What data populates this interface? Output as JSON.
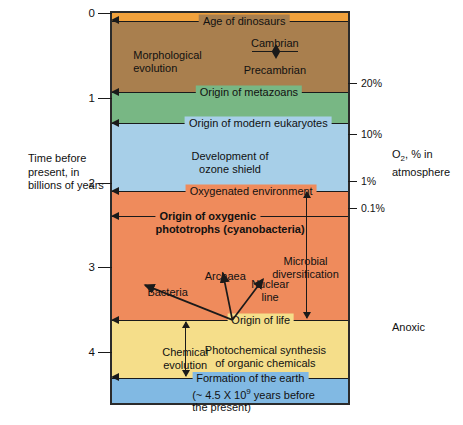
{
  "figure": {
    "left_axis_caption_line1": "Time before",
    "left_axis_caption_line2": "present, in",
    "left_axis_caption_line3": "billions of years",
    "right_axis_caption_line1": "O",
    "right_axis_caption_sub": "2",
    "right_axis_caption_line1b": ", % in",
    "right_axis_caption_line2": "atmosphere",
    "anoxic_label": "Anoxic"
  },
  "chart_data": {
    "type": "timeline",
    "ylabel": "Time before present, in billions of years",
    "ylim": [
      0,
      4.6
    ],
    "y_ticks": [
      {
        "label": "0",
        "value": 0
      },
      {
        "label": "1",
        "value": 1
      },
      {
        "label": "2",
        "value": 2
      },
      {
        "label": "3",
        "value": 3
      },
      {
        "label": "4",
        "value": 4
      }
    ],
    "right_axis_label": "O2, % in atmosphere",
    "right_ticks": [
      {
        "label": "20%",
        "value": 0.83
      },
      {
        "label": "10%",
        "value": 1.43
      },
      {
        "label": "1%",
        "value": 1.98
      },
      {
        "label": "0.1%",
        "value": 2.3
      }
    ],
    "grid": false,
    "legend": "none",
    "bands": [
      {
        "name": "present-atmosphere",
        "color": "#f2a23c",
        "from": 0.0,
        "to": 0.09
      },
      {
        "name": "morphological-evolution-era",
        "color": "#a97f4e",
        "from": 0.09,
        "to": 0.93
      },
      {
        "name": "metazoan-era",
        "color": "#78b784",
        "from": 0.93,
        "to": 1.3
      },
      {
        "name": "ozone-shield-era",
        "color": "#a7cfe8",
        "from": 1.3,
        "to": 2.1
      },
      {
        "name": "oxygenic-phototroph-era",
        "color": "#ef8b5c",
        "from": 2.1,
        "to": 3.62
      },
      {
        "name": "prebiotic-era",
        "color": "#f5de8a",
        "from": 3.62,
        "to": 4.3
      },
      {
        "name": "pre-earth",
        "color": "#81b9e3",
        "from": 4.3,
        "to": 4.6
      }
    ],
    "events": [
      {
        "label": "Age of dinosaurs",
        "value": 0.09,
        "bold": false,
        "text_x_pct": 56
      },
      {
        "label": "Origin of metazoans",
        "value": 0.93,
        "bold": false,
        "text_x_pct": 58
      },
      {
        "label": "Origin of modern eukaryotes",
        "value": 1.3,
        "bold": false,
        "text_x_pct": 62
      },
      {
        "label": "Oxygenated environment",
        "value": 2.1,
        "bold": false,
        "text_x_pct": 59
      },
      {
        "label": "Origin of oxygenic",
        "label2": "phototrophs (cyanobacteria)",
        "value": 2.4,
        "bold": true,
        "text_x_pct": 50
      },
      {
        "label": "Origin of life",
        "value": 3.62,
        "bold": false,
        "text_x_pct": 63
      },
      {
        "label": "Formation of the earth",
        "label2": "(~ 4.5 X 10",
        "label2_sup": "9",
        "label2_tail": " years before",
        "label3": "the present)",
        "value": 4.3,
        "bold": false,
        "text_x_pct": 60
      }
    ],
    "annotations": [
      {
        "name": "morphological-evolution",
        "line1": "Morphological",
        "line2": "evolution",
        "x_pct": 9,
        "value": 0.42
      },
      {
        "name": "cambrian",
        "label": "Cambrian",
        "x_pct": 69,
        "value": 0.28
      },
      {
        "name": "precambrian",
        "label": "Precambrian",
        "x_pct": 69,
        "value": 0.6
      },
      {
        "name": "development-of-ozone-shield",
        "line1": "Development of",
        "line2": "ozone shield",
        "x_pct": 50,
        "value": 1.62
      },
      {
        "name": "microbial-diversification",
        "line1": "Microbial",
        "line2": "diversification",
        "x_pct": 82,
        "value": 2.85
      },
      {
        "name": "archaea",
        "label": "Archaea",
        "x_pct": 48,
        "value": 3.03
      },
      {
        "name": "nuclear-line",
        "line1": "Nuclear",
        "line2": "line",
        "x_pct": 67,
        "value": 3.12
      },
      {
        "name": "bacteria",
        "label": "Bacteria",
        "x_pct": 15,
        "value": 3.22
      },
      {
        "name": "chemical-evolution",
        "line1": "Chemical",
        "line2": "evolution",
        "x_pct": 31,
        "value": 3.93
      },
      {
        "name": "photochemical-synthesis",
        "line1": "Photochemical synthesis",
        "line2": "of organic chemicals",
        "x_pct": 65,
        "value": 3.9
      },
      {
        "name": "anoxic",
        "label": "Anoxic",
        "x_pct": 118,
        "value": 3.92
      }
    ]
  }
}
